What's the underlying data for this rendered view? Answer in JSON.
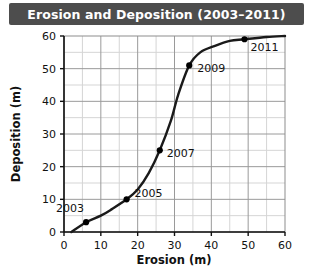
{
  "title": "Erosion and Deposition (2003–2011)",
  "colors": {
    "title_bar_bg": "#4d4d4d",
    "title_text": "#ffffff",
    "curve": "#1a1a1a",
    "point": "#000000",
    "grid_major": "#9a9a9a",
    "grid_minor": "#d5d5d5",
    "axis": "#111111",
    "background": "#ffffff"
  },
  "chart_data": {
    "type": "line",
    "title": "Erosion and Deposition (2003–2011)",
    "xlabel": "Erosion (m)",
    "ylabel": "Deposition (m)",
    "xlim": [
      0,
      60
    ],
    "ylim": [
      0,
      60
    ],
    "xticks": [
      0,
      10,
      20,
      30,
      40,
      50,
      60
    ],
    "yticks": [
      0,
      10,
      20,
      30,
      40,
      50,
      60
    ],
    "xtick_labels": [
      "0",
      "10",
      "20",
      "30",
      "40",
      "50",
      "60"
    ],
    "ytick_labels": [
      "0",
      "10",
      "20",
      "30",
      "40",
      "50",
      "60"
    ],
    "grid": true,
    "grid_minor_step": 5,
    "legend": "none",
    "series": [
      {
        "name": "Erosion vs Deposition",
        "points": [
          {
            "label": "2003",
            "x": 6,
            "y": 3
          },
          {
            "label": "2005",
            "x": 17,
            "y": 10
          },
          {
            "label": "2007",
            "x": 26,
            "y": 25
          },
          {
            "label": "2009",
            "x": 34,
            "y": 51
          },
          {
            "label": "2011",
            "x": 49,
            "y": 59
          }
        ],
        "curve": [
          {
            "x": 2,
            "y": 0
          },
          {
            "x": 6,
            "y": 3
          },
          {
            "x": 10,
            "y": 5
          },
          {
            "x": 13,
            "y": 7
          },
          {
            "x": 17,
            "y": 10
          },
          {
            "x": 20,
            "y": 13
          },
          {
            "x": 23,
            "y": 18
          },
          {
            "x": 26,
            "y": 25
          },
          {
            "x": 29,
            "y": 34
          },
          {
            "x": 31,
            "y": 42
          },
          {
            "x": 34,
            "y": 51
          },
          {
            "x": 37,
            "y": 55
          },
          {
            "x": 41,
            "y": 57
          },
          {
            "x": 45,
            "y": 58.5
          },
          {
            "x": 49,
            "y": 59
          },
          {
            "x": 55,
            "y": 59.7
          },
          {
            "x": 60,
            "y": 60
          }
        ]
      }
    ]
  }
}
